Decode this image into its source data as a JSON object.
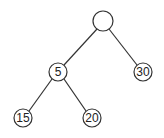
{
  "tree": {
    "nodes": [
      {
        "id": "root",
        "label": "",
        "cx": 103,
        "cy": 21,
        "r": 10
      },
      {
        "id": "n5",
        "label": "5",
        "cx": 58,
        "cy": 72,
        "r": 9
      },
      {
        "id": "n30",
        "label": "30",
        "cx": 143,
        "cy": 72,
        "r": 9
      },
      {
        "id": "n15",
        "label": "15",
        "cx": 23,
        "cy": 118,
        "r": 9
      },
      {
        "id": "n20",
        "label": "20",
        "cx": 92,
        "cy": 118,
        "r": 9
      }
    ],
    "edges": [
      {
        "from": "root",
        "to": "n5"
      },
      {
        "from": "root",
        "to": "n30"
      },
      {
        "from": "n5",
        "to": "n15"
      },
      {
        "from": "n5",
        "to": "n20"
      }
    ]
  }
}
